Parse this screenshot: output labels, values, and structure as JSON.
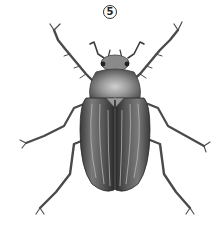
{
  "figure": {
    "label": "5"
  },
  "colors": {
    "background": "#ffffff",
    "ink_dark": "#2a2a2a",
    "ink_mid": "#6a6a6a",
    "ink_light": "#b8b8b8",
    "label_border": "#333333"
  }
}
